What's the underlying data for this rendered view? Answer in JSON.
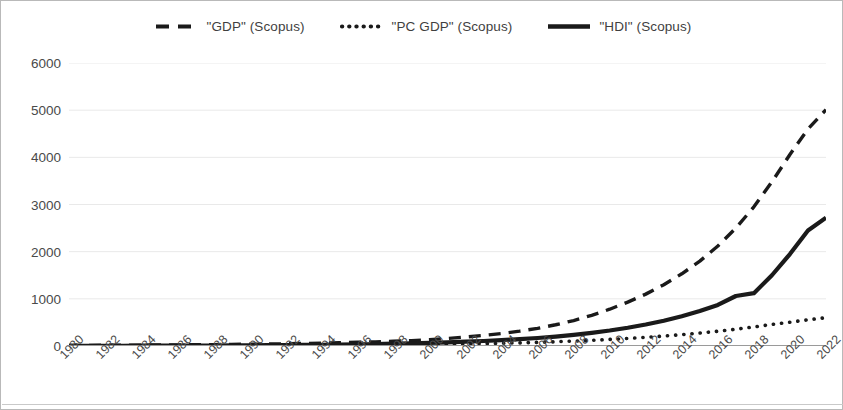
{
  "legend": {
    "position": "top-center",
    "items": [
      {
        "label": "\"GDP\" (Scopus)",
        "key": "dashed-line-marker",
        "style": "dashed"
      },
      {
        "label": "\"PC GDP\" (Scopus)",
        "key": "dotted-line-marker",
        "style": "dotted"
      },
      {
        "label": "\"HDI\" (Scopus)",
        "key": "solid-line-marker",
        "style": "solid"
      }
    ]
  },
  "colors": {
    "series_line": "#1a1a1a",
    "gridline": "#e9e9e9",
    "axis": "#9a9a9a",
    "tick_text": "#4a4a4a",
    "frame": "#b9b9b9",
    "background": "#ffffff"
  },
  "axes": {
    "y_ticks": [
      "0",
      "1000",
      "2000",
      "3000",
      "4000",
      "5000",
      "6000"
    ],
    "x_ticks": [
      "1980",
      "1982",
      "1984",
      "1986",
      "1988",
      "1990",
      "1992",
      "1994",
      "1996",
      "1998",
      "2000",
      "2002",
      "2004",
      "2006",
      "2008",
      "2010",
      "2012",
      "2014",
      "2016",
      "2018",
      "2020",
      "2022"
    ]
  },
  "chart_data": {
    "type": "line",
    "title": "",
    "subtitle": "",
    "xlabel": "",
    "ylabel": "",
    "xlim": [
      1980,
      2022
    ],
    "ylim": [
      0,
      6000
    ],
    "grid": true,
    "legend_position": "top-center",
    "x": [
      1980,
      1981,
      1982,
      1983,
      1984,
      1985,
      1986,
      1987,
      1988,
      1989,
      1990,
      1991,
      1992,
      1993,
      1994,
      1995,
      1996,
      1997,
      1998,
      1999,
      2000,
      2001,
      2002,
      2003,
      2004,
      2005,
      2006,
      2007,
      2008,
      2009,
      2010,
      2011,
      2012,
      2013,
      2014,
      2015,
      2016,
      2017,
      2018,
      2019,
      2020,
      2021,
      2022
    ],
    "series": [
      {
        "name": "\"GDP\" (Scopus)",
        "style": "dashed",
        "values": [
          12,
          14,
          15,
          17,
          19,
          22,
          24,
          27,
          30,
          34,
          38,
          42,
          47,
          53,
          60,
          68,
          78,
          88,
          100,
          115,
          135,
          160,
          190,
          225,
          265,
          315,
          375,
          450,
          540,
          650,
          780,
          930,
          1100,
          1300,
          1530,
          1800,
          2120,
          2500,
          2950,
          3480,
          4060,
          4600,
          5010
        ]
      },
      {
        "name": "\"PC GDP\" (Scopus)",
        "style": "dotted",
        "values": [
          1,
          1,
          2,
          2,
          3,
          3,
          4,
          4,
          5,
          6,
          7,
          8,
          9,
          11,
          13,
          15,
          17,
          20,
          23,
          27,
          31,
          36,
          42,
          49,
          57,
          66,
          77,
          90,
          104,
          120,
          139,
          160,
          184,
          211,
          241,
          275,
          313,
          356,
          404,
          458,
          505,
          555,
          600
        ]
      },
      {
        "name": "\"HDI\" (Scopus)",
        "style": "solid",
        "values": [
          3,
          4,
          4,
          5,
          6,
          7,
          8,
          9,
          11,
          13,
          15,
          17,
          20,
          23,
          27,
          31,
          36,
          42,
          49,
          57,
          67,
          78,
          91,
          106,
          124,
          145,
          170,
          200,
          236,
          278,
          328,
          387,
          455,
          535,
          630,
          740,
          870,
          1060,
          1120,
          1500,
          1950,
          2450,
          2720
        ]
      }
    ]
  }
}
